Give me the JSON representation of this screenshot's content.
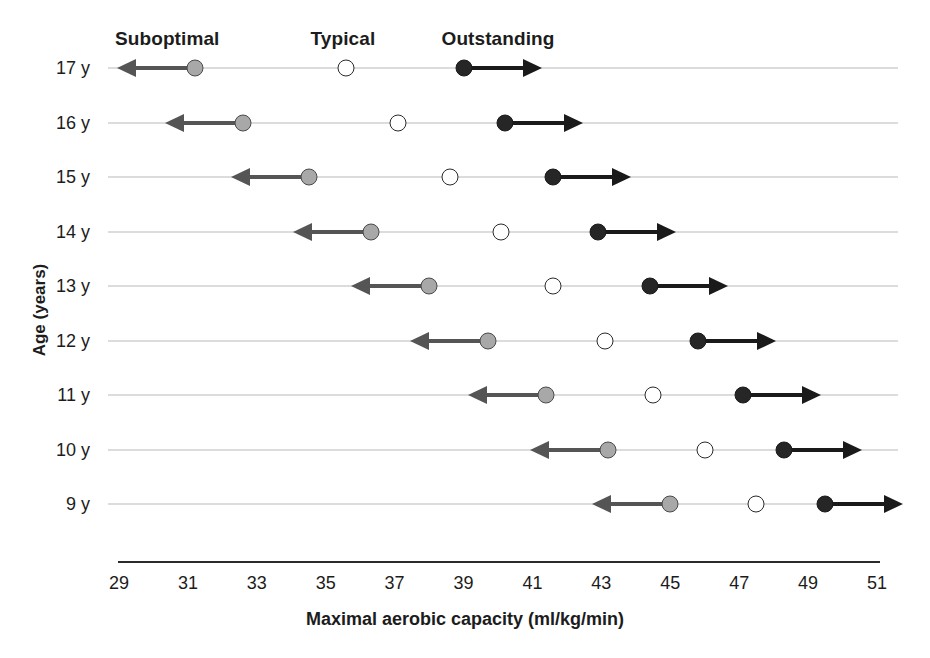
{
  "chart_data": {
    "type": "scatter",
    "title": "",
    "xlabel": "Maximal aerobic capacity (ml/kg/min)",
    "ylabel": "Age (years)",
    "xlim": [
      29,
      51
    ],
    "xticks": [
      29,
      31,
      33,
      35,
      37,
      39,
      41,
      43,
      45,
      47,
      49,
      51
    ],
    "xtick_labels": [
      "29",
      "31",
      "33",
      "35",
      "37",
      "39",
      "41",
      "43",
      "45",
      "47",
      "49",
      "51"
    ],
    "grid": false,
    "legend_position": "top",
    "categories": [
      "17 y",
      "16 y",
      "15 y",
      "14 y",
      "13 y",
      "12 y",
      "11 y",
      "10 y",
      "9 y"
    ],
    "series": [
      {
        "name": "Suboptimal",
        "marker": "filled-gray-circle",
        "arrow_direction": "left",
        "color": "#a8a8a8",
        "values": [
          31.2,
          32.6,
          34.5,
          36.3,
          38.0,
          39.7,
          41.4,
          43.2,
          45.0
        ]
      },
      {
        "name": "Typical",
        "marker": "open-circle",
        "arrow_direction": "none",
        "color": "#ffffff",
        "values": [
          35.6,
          37.1,
          38.6,
          40.1,
          41.6,
          43.1,
          44.5,
          46.0,
          47.5
        ]
      },
      {
        "name": "Outstanding",
        "marker": "filled-black-circle",
        "arrow_direction": "right",
        "color": "#262626",
        "values": [
          39.0,
          40.2,
          41.6,
          42.9,
          44.4,
          45.8,
          47.1,
          48.3,
          49.5
        ]
      }
    ],
    "annotations": [
      {
        "text": "Suboptimal",
        "x": 30.4
      },
      {
        "text": "Typical",
        "x": 35.5
      },
      {
        "text": "Outstanding",
        "x": 40.0
      }
    ]
  },
  "axes": {
    "y_title": "Age (years)",
    "x_title": "Maximal aerobic capacity (ml/kg/min)"
  },
  "legend": {
    "suboptimal": "Suboptimal",
    "typical": "Typical",
    "outstanding": "Outstanding"
  },
  "colors": {
    "suboptimal_fill": "#a8a8a8",
    "suboptimal_arrow": "#555555",
    "typical_fill": "#ffffff",
    "typical_stroke": "#2a2a2a",
    "outstanding_fill": "#262626",
    "outstanding_arrow": "#1a1a1a",
    "row_line": "#b9b9b9",
    "axis": "#2b2b2b",
    "text": "#1c1c1c"
  }
}
